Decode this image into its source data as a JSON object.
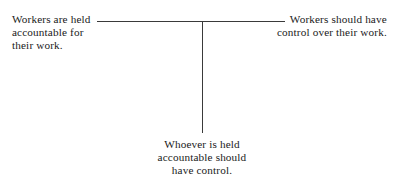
{
  "diagram": {
    "type": "t-junction-relationship",
    "background_color": "#ffffff",
    "line_color": "#3a3a3a",
    "text_color": "#1a1a1a",
    "nodes": {
      "left": {
        "name": "workers-are-held-accountable",
        "align": "left",
        "lines": [
          "Workers are held",
          "accountable for",
          "their work."
        ]
      },
      "right": {
        "name": "workers-should-have-control",
        "align": "right",
        "lines": [
          "Workers should have",
          "control over their work."
        ]
      },
      "bottom": {
        "name": "whoever-is-held-accountable-should-have-control",
        "align": "center",
        "lines": [
          "Whoever is held",
          "accountable should",
          "have control."
        ]
      }
    },
    "connectors": [
      {
        "name": "horizontal-connector",
        "orientation": "horizontal",
        "from": "left",
        "to": "right"
      },
      {
        "name": "vertical-connector",
        "orientation": "vertical",
        "from": "junction",
        "to": "bottom"
      }
    ]
  }
}
